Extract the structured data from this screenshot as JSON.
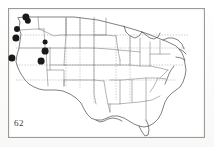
{
  "figure": {
    "number_label": "62",
    "title": "Distribution map of the United States",
    "frame": {
      "x": 8,
      "y": 8,
      "width": 197,
      "height": 130,
      "border_color": "#9a9a98"
    },
    "background_color": "#ffffff",
    "ink_color": "#3a3a3a"
  },
  "map": {
    "name": "united-states-state-outlines",
    "projection_note": "conterminous United States, state boundaries",
    "outline_color": "#4a4a4a",
    "state_border_color": "#6e6e6e",
    "region_labels": []
  },
  "chart_data": {
    "type": "scatter",
    "title": "62",
    "xlabel": "",
    "ylabel": "",
    "marker": "filled-circle",
    "marker_color": "#1a1a1a",
    "point_count": 8,
    "points": [
      {
        "id": "p1",
        "x": 26,
        "y": 17,
        "r": 3.6,
        "region": "northern-washington"
      },
      {
        "id": "p2",
        "x": 28,
        "y": 21,
        "r": 3.2,
        "region": "central-washington"
      },
      {
        "id": "p3",
        "x": 17,
        "y": 29,
        "r": 3.0,
        "region": "western-oregon"
      },
      {
        "id": "p4",
        "x": 16,
        "y": 38,
        "r": 3.6,
        "region": "southern-oregon"
      },
      {
        "id": "p5",
        "x": 12,
        "y": 58,
        "r": 3.6,
        "region": "northern-california"
      },
      {
        "id": "p6",
        "x": 45,
        "y": 42,
        "r": 2.4,
        "region": "southern-idaho"
      },
      {
        "id": "p7",
        "x": 45,
        "y": 51,
        "r": 3.4,
        "region": "northern-utah"
      },
      {
        "id": "p8",
        "x": 41,
        "y": 61,
        "r": 3.4,
        "region": "central-utah"
      }
    ]
  }
}
